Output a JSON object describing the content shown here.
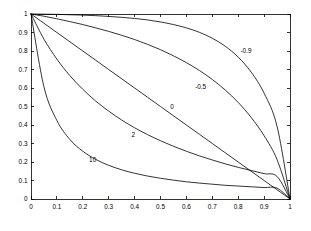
{
  "figure": {
    "background_color": "#ffffff",
    "axes_color": "#000000",
    "line_color": "#000000"
  },
  "chart_data": {
    "type": "line",
    "title": "",
    "subtitle": "",
    "xlabel": "",
    "ylabel": "",
    "xlim": [
      0,
      1
    ],
    "ylim": [
      0,
      1
    ],
    "grid": false,
    "legend_position": "inline-annotations",
    "xticks": [
      "0",
      "0.1",
      "0.2",
      "0.3",
      "0.4",
      "0.5",
      "0.6",
      "0.7",
      "0.8",
      "0.9",
      "1"
    ],
    "xtick_values": [
      0,
      0.1,
      0.2,
      0.3,
      0.4,
      0.5,
      0.6,
      0.7,
      0.8,
      0.9,
      1
    ],
    "yticks": [
      "0",
      "0.1",
      "0.2",
      "0.3",
      "0.4",
      "0.5",
      "0.6",
      "0.7",
      "0.8",
      "0.9",
      "1"
    ],
    "ytick_values": [
      0,
      0.1,
      0.2,
      0.3,
      0.4,
      0.5,
      0.6,
      0.7,
      0.8,
      0.9,
      1
    ],
    "x": [
      0,
      0.05,
      0.1,
      0.15,
      0.2,
      0.25,
      0.3,
      0.35,
      0.4,
      0.45,
      0.5,
      0.55,
      0.6,
      0.65,
      0.7,
      0.75,
      0.8,
      0.85,
      0.9,
      0.95,
      1
    ],
    "series": [
      {
        "name": "-0.9",
        "label": "-0.9",
        "label_x": 0.83,
        "label_y": 0.8,
        "values": [
          1.0,
          0.999,
          0.998,
          0.996,
          0.994,
          0.991,
          0.987,
          0.982,
          0.976,
          0.968,
          0.957,
          0.943,
          0.925,
          0.901,
          0.869,
          0.826,
          0.767,
          0.686,
          0.572,
          0.393,
          0.0
        ]
      },
      {
        "name": "-0.5",
        "label": "-0.5",
        "label_x": 0.655,
        "label_y": 0.605,
        "values": [
          1.0,
          0.988,
          0.974,
          0.959,
          0.943,
          0.925,
          0.906,
          0.885,
          0.862,
          0.836,
          0.807,
          0.774,
          0.737,
          0.695,
          0.646,
          0.589,
          0.522,
          0.441,
          0.342,
          0.213,
          0.0
        ]
      },
      {
        "name": "0",
        "label": "0",
        "label_x": 0.545,
        "label_y": 0.497,
        "values": [
          1.0,
          0.95,
          0.9,
          0.85,
          0.8,
          0.75,
          0.7,
          0.65,
          0.6,
          0.55,
          0.5,
          0.45,
          0.4,
          0.35,
          0.3,
          0.25,
          0.2,
          0.15,
          0.1,
          0.05,
          0.0
        ]
      },
      {
        "name": "2",
        "label": "2",
        "label_x": 0.395,
        "label_y": 0.345,
        "values": [
          1.0,
          0.864,
          0.756,
          0.667,
          0.593,
          0.529,
          0.475,
          0.427,
          0.385,
          0.348,
          0.315,
          0.285,
          0.258,
          0.233,
          0.211,
          0.19,
          0.171,
          0.154,
          0.137,
          0.122,
          0.0
        ]
      },
      {
        "name": "10",
        "label": "10",
        "label_x": 0.238,
        "label_y": 0.215,
        "values": [
          1.0,
          0.606,
          0.424,
          0.322,
          0.258,
          0.214,
          0.182,
          0.158,
          0.139,
          0.124,
          0.112,
          0.102,
          0.093,
          0.086,
          0.08,
          0.074,
          0.07,
          0.066,
          0.062,
          0.059,
          0.0
        ]
      }
    ]
  }
}
